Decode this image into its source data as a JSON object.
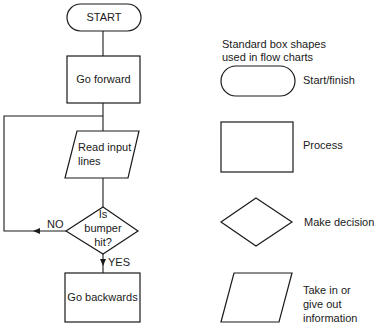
{
  "flowchart": {
    "start": "START",
    "go_forward": "Go forward",
    "read_input": [
      "Read input",
      "lines"
    ],
    "decision": [
      "Is",
      "bumper",
      "hit?"
    ],
    "no_label": "NO",
    "yes_label": "YES",
    "go_backwards": "Go backwards"
  },
  "legend": {
    "title": [
      "Standard box shapes",
      "used in flow charts"
    ],
    "items": [
      {
        "shape": "rounded-pill",
        "label": "Start/finish"
      },
      {
        "shape": "rectangle",
        "label": "Process"
      },
      {
        "shape": "diamond",
        "label": "Make decision"
      },
      {
        "shape": "parallelogram",
        "label_lines": [
          "Take in or",
          "give out",
          "information"
        ]
      }
    ]
  },
  "colors": {
    "stroke": "#1a1a1a",
    "background": "#ffffff"
  }
}
